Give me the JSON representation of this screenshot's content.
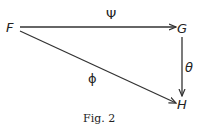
{
  "diagram": {
    "nodes": [
      {
        "id": "F",
        "label": "F"
      },
      {
        "id": "G",
        "label": "G"
      },
      {
        "id": "H",
        "label": "H"
      }
    ],
    "edges": [
      {
        "from": "F",
        "to": "G",
        "label": "Ψ"
      },
      {
        "from": "G",
        "to": "H",
        "label": "θ"
      },
      {
        "from": "F",
        "to": "H",
        "label": "ϕ"
      }
    ]
  },
  "caption": "Fig. 2"
}
